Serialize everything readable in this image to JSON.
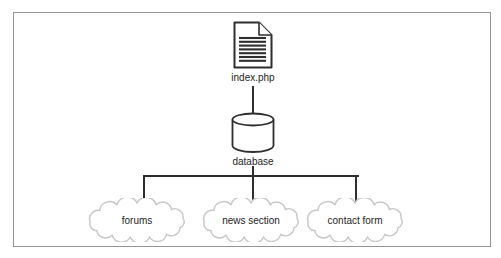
{
  "diagram": {
    "document_node": {
      "label": "index.php",
      "icon": "document-icon"
    },
    "database_node": {
      "label": "database",
      "icon": "database-cylinder-icon"
    },
    "cloud_nodes": [
      {
        "label": "forums",
        "icon": "cloud-icon"
      },
      {
        "label": "news section",
        "icon": "cloud-icon"
      },
      {
        "label": "contact form",
        "icon": "cloud-icon"
      }
    ],
    "edges": [
      {
        "from": "index.php",
        "to": "database"
      },
      {
        "from": "database",
        "to": "forums"
      },
      {
        "from": "database",
        "to": "news section"
      },
      {
        "from": "database",
        "to": "contact form"
      }
    ],
    "colors": {
      "connector": "#2e2e2e",
      "node_stroke": "#2e2e2e",
      "cloud_outline": "#c8c8c8",
      "frame_border": "#949494",
      "background": "#ffffff",
      "label_text": "#1c1c1c"
    }
  }
}
